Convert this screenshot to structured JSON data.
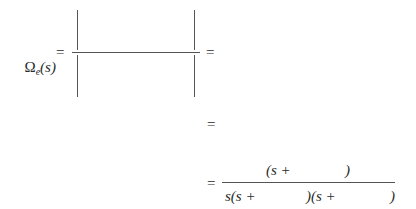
{
  "equation": {
    "lhs": {
      "symbol": "Ω",
      "subscript": "e",
      "argument": "(s)",
      "equals": "="
    },
    "determinant_fraction": {
      "numerator": "",
      "denominator": "",
      "trailing_equals": "="
    },
    "line2": {
      "equals": "=",
      "content": ""
    },
    "line3": {
      "equals": "=",
      "numerator": {
        "open": "(s +",
        "blank": "",
        "close": ")"
      },
      "denominator": {
        "part1": "s(s +",
        "blank1": "",
        "part2": ")(s +",
        "blank2": "",
        "close": ")"
      }
    }
  }
}
